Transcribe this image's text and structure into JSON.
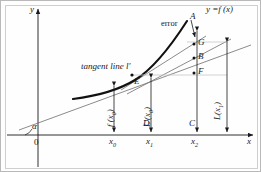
{
  "figure": {
    "background": "#fefefe",
    "frame_color": "#b9b9b9",
    "ink_color": "#1a1a1a",
    "axes": {
      "x_label": "x",
      "y_label": "y",
      "origin_label": "0",
      "angle_label": "α"
    },
    "curve_label": "y =f (x)",
    "tangent_label": "tangent line l′",
    "error_label": "error",
    "x_ticks": [
      {
        "name": "x0",
        "text": "x",
        "sub": "0"
      },
      {
        "name": "x1",
        "text": "x",
        "sub": "1"
      },
      {
        "name": "x2",
        "text": "x",
        "sub": "2"
      }
    ],
    "points": [
      {
        "name": "A",
        "label": "A"
      },
      {
        "name": "G",
        "label": "G"
      },
      {
        "name": "B",
        "label": "B"
      },
      {
        "name": "F",
        "label": "F"
      },
      {
        "name": "E",
        "label": "E"
      },
      {
        "name": "D",
        "label": "D"
      },
      {
        "name": "C",
        "label": "C"
      }
    ],
    "vertical_labels": [
      {
        "name": "f-x0",
        "text": "f (x",
        "sub": "0",
        "close": ")"
      },
      {
        "name": "Lprime-x0",
        "text": "L′(x",
        "sub": "0",
        "close": ")"
      },
      {
        "name": "L-x1",
        "text": "L(x",
        "sub": "1",
        "close": ")"
      }
    ]
  }
}
